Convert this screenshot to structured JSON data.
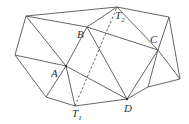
{
  "diagram": {
    "type": "triangulated polygon network",
    "points": {
      "P1": [
        26,
        16
      ],
      "T2": [
        117,
        7
      ],
      "PTR": [
        169,
        17
      ],
      "B": [
        87,
        27
      ],
      "C": [
        158,
        50
      ],
      "PL": [
        15,
        55
      ],
      "A": [
        66,
        66
      ],
      "PR": [
        180,
        79
      ],
      "PBL": [
        46,
        97
      ],
      "T1": [
        75,
        106
      ],
      "D": [
        127,
        99
      ],
      "BRM": [
        148,
        87
      ]
    },
    "edges": [
      [
        "P1",
        "T2"
      ],
      [
        "T2",
        "PTR"
      ],
      [
        "P1",
        "PL"
      ],
      [
        "P1",
        "A"
      ],
      [
        "P1",
        "B"
      ],
      [
        "B",
        "C"
      ],
      [
        "T2",
        "B"
      ],
      [
        "T2",
        "C"
      ],
      [
        "PTR",
        "C"
      ],
      [
        "PTR",
        "PR"
      ],
      [
        "C",
        "PR"
      ],
      [
        "C",
        "D"
      ],
      [
        "C",
        "BRM"
      ],
      [
        "BRM",
        "PR"
      ],
      [
        "BRM",
        "D"
      ],
      [
        "B",
        "A"
      ],
      [
        "B",
        "D"
      ],
      [
        "PL",
        "A"
      ],
      [
        "A",
        "D"
      ],
      [
        "PL",
        "PBL"
      ],
      [
        "PBL",
        "A"
      ],
      [
        "A",
        "T1"
      ],
      [
        "PBL",
        "T1"
      ],
      [
        "T1",
        "D"
      ]
    ],
    "dashed_edges": [
      [
        "T1",
        "T2"
      ]
    ],
    "labels": {
      "A": "A",
      "B": "B",
      "C": "C",
      "D": "D",
      "T1_main": "T",
      "T1_sub": "1",
      "T2_main": "T",
      "T2_sub": "2"
    }
  }
}
